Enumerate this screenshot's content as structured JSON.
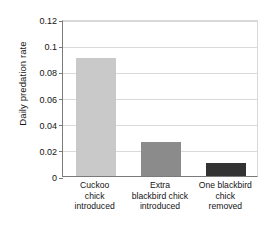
{
  "chart_data": {
    "type": "bar",
    "title": "",
    "xlabel": "",
    "ylabel": "Daily predation rate",
    "categories": [
      "Cuckoo chick introduced",
      "Extra blackbird chick introduced",
      "One blackbird chick removed"
    ],
    "category_lines": [
      [
        "Cuckoo",
        "chick",
        "introduced"
      ],
      [
        "Extra",
        "blackbird chick",
        "introduced"
      ],
      [
        "One blackbird",
        "chick",
        "removed"
      ]
    ],
    "values": [
      0.09,
      0.026,
      0.01
    ],
    "ylim": [
      0,
      0.12
    ],
    "ytick_values": [
      0,
      0.02,
      0.04,
      0.06,
      0.08,
      0.1,
      0.12
    ],
    "ytick_labels": [
      "0",
      "0.02",
      "0.04",
      "0.06",
      "0.08",
      "0.1",
      "0.12"
    ],
    "grid": true,
    "legend": "none",
    "bar_colors": [
      "#c9c9c9",
      "#8b8b8b",
      "#333333"
    ],
    "grid_color": "#d9d9d9",
    "axis_color": "#7a7a7a"
  }
}
